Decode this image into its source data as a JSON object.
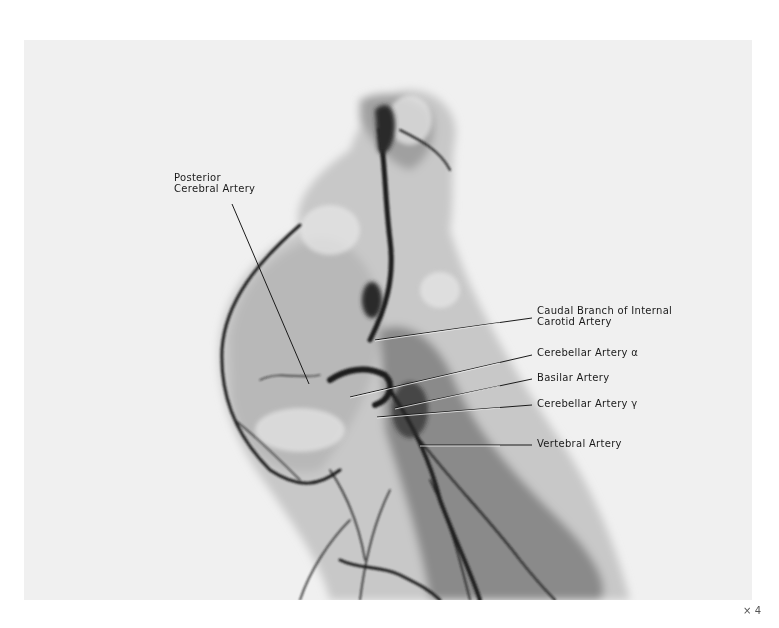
{
  "figure": {
    "type": "radiograph",
    "magnification": "× 4",
    "labels": [
      {
        "id": "posterior-cerebral",
        "lines": [
          "Posterior",
          "Cerebral Artery"
        ]
      },
      {
        "id": "caudal-branch",
        "lines": [
          "Caudal Branch of Internal",
          "Carotid Artery"
        ]
      },
      {
        "id": "cerebellar-alpha",
        "lines": [
          "Cerebellar Artery α"
        ]
      },
      {
        "id": "basilar",
        "lines": [
          "Basilar Artery"
        ]
      },
      {
        "id": "cerebellar-gamma",
        "lines": [
          "Cerebellar Artery γ"
        ]
      },
      {
        "id": "vertebral",
        "lines": [
          "Vertebral Artery"
        ]
      }
    ]
  }
}
